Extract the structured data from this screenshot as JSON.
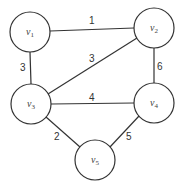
{
  "graph": {
    "nodes": [
      {
        "id": "v1",
        "base": "v",
        "sub": "1",
        "x": 30,
        "y": 32
      },
      {
        "id": "v2",
        "base": "v",
        "sub": "2",
        "x": 154,
        "y": 28
      },
      {
        "id": "v3",
        "base": "v",
        "sub": "3",
        "x": 31,
        "y": 104
      },
      {
        "id": "v4",
        "base": "v",
        "sub": "4",
        "x": 154,
        "y": 103
      },
      {
        "id": "v5",
        "base": "v",
        "sub": "5",
        "x": 95,
        "y": 160
      }
    ],
    "edges": [
      {
        "from": "v1",
        "to": "v2",
        "weight": "1"
      },
      {
        "from": "v1",
        "to": "v3",
        "weight": "3"
      },
      {
        "from": "v2",
        "to": "v3",
        "weight": "3"
      },
      {
        "from": "v2",
        "to": "v4",
        "weight": "6"
      },
      {
        "from": "v3",
        "to": "v4",
        "weight": "4"
      },
      {
        "from": "v3",
        "to": "v5",
        "weight": "2"
      },
      {
        "from": "v4",
        "to": "v5",
        "weight": "5"
      }
    ]
  }
}
